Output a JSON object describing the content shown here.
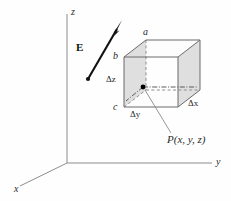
{
  "figure": {
    "kind": "3d-vector-diagram",
    "background_color": "#fefefe",
    "axes": {
      "z_label": "z",
      "y_label": "y",
      "x_label": "x",
      "line_color": "#8d8d8d"
    },
    "field_vector": {
      "label": "E",
      "color": "#111111",
      "description": "electric-field-arrow"
    },
    "box": {
      "vertex_labels": {
        "top": "a",
        "upper_left": "b",
        "lower_left": "c"
      },
      "dimension_labels": {
        "height": "Δz",
        "depth": "Δy",
        "width": "Δx"
      },
      "shaded_face_color": "#d2d2d2",
      "edge_color": "#6b6b6b"
    },
    "point": {
      "label": "P(x, y, z)",
      "marker_color": "#000000"
    }
  }
}
